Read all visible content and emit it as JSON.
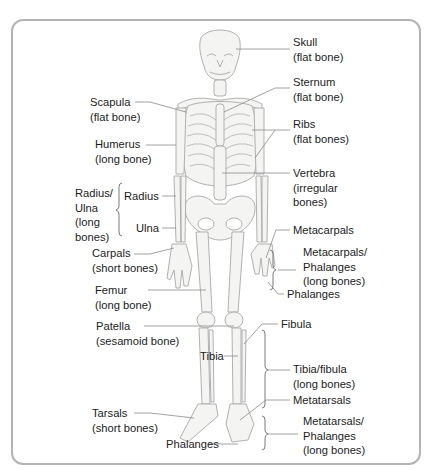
{
  "figure": {
    "labels": {
      "skull": {
        "name": "Skull",
        "type": "(flat bone)"
      },
      "sternum": {
        "name": "Sternum",
        "type": "(flat bone)"
      },
      "scapula": {
        "name": "Scapula",
        "type": "(flat bone)"
      },
      "ribs": {
        "name": "Ribs",
        "type": "(flat bones)"
      },
      "humerus": {
        "name": "Humerus",
        "type": "(long bone)"
      },
      "vertebra": {
        "name": "Vertebra",
        "type1": "(irregular",
        "type2": "bones)"
      },
      "radius_ulna_group": {
        "line1": "Radius/",
        "line2": "Ulna",
        "line3": "(long",
        "line4": "bones)"
      },
      "radius": {
        "name": "Radius"
      },
      "ulna": {
        "name": "Ulna"
      },
      "carpals": {
        "name": "Carpals",
        "type": "(short bones)"
      },
      "metacarpals": {
        "name": "Metacarpals"
      },
      "metacarpals_phalanges_group": {
        "line1": "Metacarpals/",
        "line2": "Phalanges",
        "line3": "(long bones)"
      },
      "phalanges_hand": {
        "name": "Phalanges"
      },
      "femur": {
        "name": "Femur",
        "type": "(long bone)"
      },
      "patella": {
        "name": "Patella",
        "type": "(sesamoid bone)"
      },
      "fibula": {
        "name": "Fibula"
      },
      "tibia": {
        "name": "Tibia"
      },
      "tibia_fibula_group": {
        "line1": "Tibia/fibula",
        "line2": "(long bones)"
      },
      "metatarsals": {
        "name": "Metatarsals"
      },
      "metatarsals_phalanges_group": {
        "line1": "Metatarsals/",
        "line2": "Phalanges",
        "line3": "(long bones)"
      },
      "tarsals": {
        "name": "Tarsals",
        "type": "(short bones)"
      },
      "phalanges_foot": {
        "name": "Phalanges"
      }
    },
    "colors": {
      "frame_border": "#b4b4b4",
      "bone_fill": "#f4f4f2",
      "bone_outline": "#a8a8a8",
      "leader_line": "#8a8a8a",
      "text": "#1c1c1c"
    }
  }
}
